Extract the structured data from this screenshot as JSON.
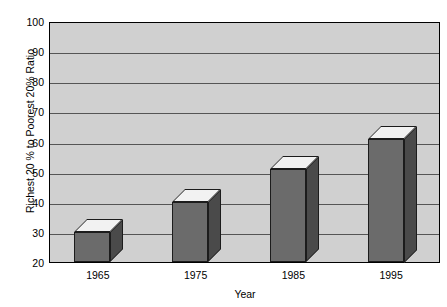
{
  "chart_data": {
    "type": "bar",
    "title": "",
    "subtitle": "",
    "xlabel": "Year",
    "ylabel": "Richest 20 % to Poorest 20% Ratio",
    "categories": [
      "1965",
      "1975",
      "1985",
      "1995"
    ],
    "values": [
      30,
      40,
      51,
      61
    ],
    "series": [
      {
        "name": "Richest 20% to Poorest 20% Ratio",
        "values": [
          30,
          40,
          51,
          61
        ]
      }
    ],
    "ylim": [
      20,
      100
    ],
    "yticks": [
      100,
      90,
      80,
      70,
      60,
      50,
      40,
      30,
      20
    ],
    "ytick_labels": [
      "100",
      "90",
      "80",
      "70",
      "60",
      "50",
      "40",
      "30",
      "20"
    ],
    "grid": true,
    "grid_axis": "y",
    "legend": false,
    "legend_position": "none",
    "style": "3d-bar",
    "colors": {
      "bar_front": "#6b6b6b",
      "bar_side": "#4a4a4a",
      "bar_top": "#f2f2f2",
      "plot_background": "#d0d0d0",
      "gridline": "#555555",
      "axis": "#000000",
      "text": "#000000",
      "page_background": "#ffffff"
    }
  }
}
